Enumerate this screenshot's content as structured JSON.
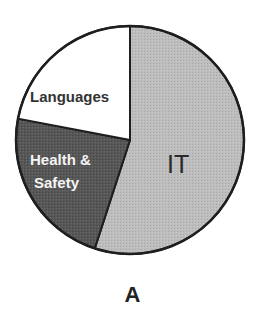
{
  "chart_data": {
    "type": "pie",
    "title": "",
    "panel_label": "A",
    "start_angle_deg": 0,
    "direction": "clockwise",
    "slices": [
      {
        "label": "IT",
        "value": 55,
        "color": "#b9b9b9",
        "text_color": "#2a2a2a"
      },
      {
        "label": "Health & Safety",
        "value": 23,
        "color": "#565656",
        "text_color": "#f4f4f4"
      },
      {
        "label": "Languages",
        "value": 22,
        "color": "#ffffff",
        "text_color": "#333333"
      }
    ],
    "legend": "none (labels drawn inside slices)",
    "stroke_color": "#1e1e1e"
  },
  "labels": {
    "languages": "Languages",
    "health_line1": "Health &",
    "health_line2": "Safety",
    "it": "IT",
    "panel": "A"
  }
}
